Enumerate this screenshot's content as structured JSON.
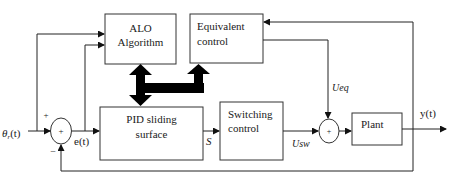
{
  "diagram": {
    "type": "block-diagram",
    "blocks": {
      "alo": {
        "line1": "ALO",
        "line2": "Algorithm"
      },
      "equivalent": {
        "line1": "Equivalent",
        "line2": "control"
      },
      "pid": {
        "line1": "PID sliding",
        "line2": "surface"
      },
      "switching": {
        "line1": "Switching",
        "line2": "control"
      },
      "plant": {
        "label": "Plant"
      }
    },
    "summing_junctions": {
      "sum1": {
        "symbol": "+",
        "plus_sign": "+",
        "minus_sign": "−"
      },
      "sum2": {
        "symbol": "+"
      }
    },
    "signals": {
      "input": "θ",
      "input_sub": "r",
      "input_suffix": "(t)",
      "error": "e(t)",
      "surface": "S",
      "ueq": "Ueq",
      "usw": "Usw",
      "output": "y(t)"
    }
  }
}
